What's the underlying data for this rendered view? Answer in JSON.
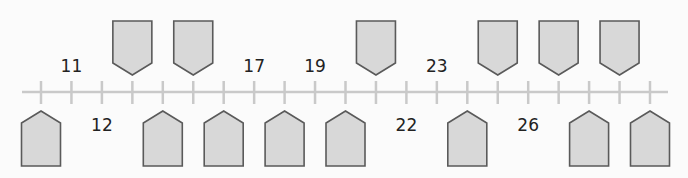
{
  "number_line": {
    "start_value": 10,
    "end_value": 30,
    "step": 1,
    "line_x_start": 22,
    "line_x_end": 668,
    "first_tick_x": 41,
    "tick_spacing": 30.45,
    "line_y": 92,
    "colors": {
      "line": "#c9c9c9",
      "shape_fill": "#d8d8d8",
      "shape_stroke": "#5a5a5a",
      "text": "#222222",
      "background": "#fbfbfb"
    }
  },
  "labels_above": [
    {
      "value": 11,
      "text": "11"
    },
    {
      "value": 17,
      "text": "17"
    },
    {
      "value": 19,
      "text": "19"
    },
    {
      "value": 23,
      "text": "23"
    }
  ],
  "labels_below": [
    {
      "value": 12,
      "text": "12"
    },
    {
      "value": 22,
      "text": "22"
    },
    {
      "value": 26,
      "text": "26"
    }
  ],
  "blank_boxes_above": [
    {
      "value": 13,
      "text": ""
    },
    {
      "value": 15,
      "text": ""
    },
    {
      "value": 21,
      "text": ""
    },
    {
      "value": 25,
      "text": ""
    },
    {
      "value": 27,
      "text": ""
    },
    {
      "value": 29,
      "text": ""
    }
  ],
  "blank_boxes_below": [
    {
      "value": 10,
      "text": ""
    },
    {
      "value": 14,
      "text": ""
    },
    {
      "value": 16,
      "text": ""
    },
    {
      "value": 18,
      "text": ""
    },
    {
      "value": 20,
      "text": ""
    },
    {
      "value": 24,
      "text": ""
    },
    {
      "value": 28,
      "text": ""
    },
    {
      "value": 30,
      "text": ""
    }
  ]
}
